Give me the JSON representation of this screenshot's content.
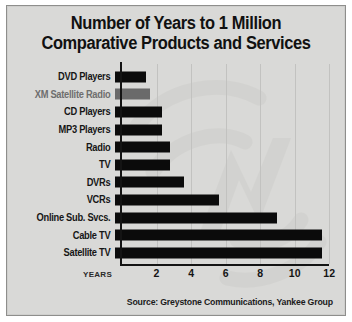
{
  "chart_data": {
    "type": "bar",
    "orientation": "horizontal",
    "title": "Number of Years to 1 Million Comparative Products and Services",
    "title_lines": [
      "Number of Years to 1 Million",
      "Comparative Products and Services"
    ],
    "xlabel": "YEARS",
    "ylabel": "",
    "xlim": [
      0,
      12.8
    ],
    "xticks": [
      2,
      4,
      6,
      8,
      10,
      12
    ],
    "xtick_labels": [
      "2",
      "4",
      "6",
      "8",
      "10",
      "12"
    ],
    "grid": "vertical",
    "legend": "none",
    "categories": [
      "DVD Players",
      "XM Satellite Radio",
      "CD Players",
      "MP3 Players",
      "Radio",
      "TV",
      "DVRs",
      "VCRs",
      "Online Sub. Svcs.",
      "Cable TV",
      "Satellite TV"
    ],
    "values": [
      1.8,
      2.0,
      2.7,
      2.7,
      3.2,
      3.2,
      4.0,
      6.0,
      9.4,
      12.0,
      12.0
    ],
    "bars": [
      {
        "label": "DVD Players",
        "value": 1.8,
        "highlighted": false
      },
      {
        "label": "XM Satellite Radio",
        "value": 2.0,
        "highlighted": true
      },
      {
        "label": "CD Players",
        "value": 2.7,
        "highlighted": false
      },
      {
        "label": "MP3 Players",
        "value": 2.7,
        "highlighted": false
      },
      {
        "label": "Radio",
        "value": 3.2,
        "highlighted": false
      },
      {
        "label": "TV",
        "value": 3.2,
        "highlighted": false
      },
      {
        "label": "DVRs",
        "value": 4.0,
        "highlighted": false
      },
      {
        "label": "VCRs",
        "value": 6.0,
        "highlighted": false
      },
      {
        "label": "Online Sub. Svcs.",
        "value": 9.4,
        "highlighted": false
      },
      {
        "label": "Cable TV",
        "value": 12.0,
        "highlighted": false
      },
      {
        "label": "Satellite TV",
        "value": 12.0,
        "highlighted": false
      }
    ],
    "annotations": {
      "source": "Source: Greystone Communications, Yankee Group"
    },
    "colors": {
      "background": "#d9d9d7",
      "bar": "#0b0b0b",
      "bar_highlight": "#6a6a6a",
      "axis": "#141414",
      "gridline": "#c2c2c0",
      "text": "#161616",
      "text_muted": "#6e6e6e",
      "watermark": "#cfcfcd"
    },
    "watermark": "xm-logo-watermark"
  }
}
